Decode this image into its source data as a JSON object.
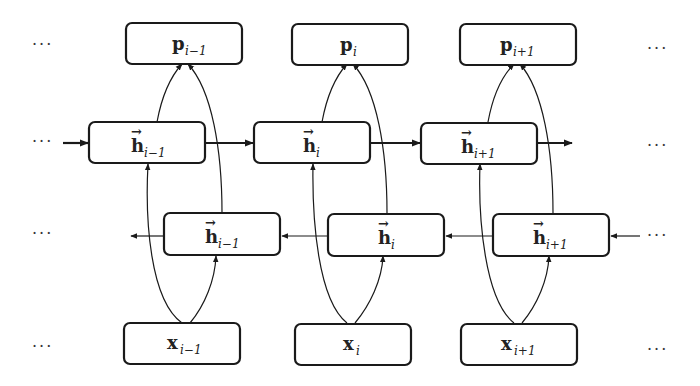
{
  "diagram": {
    "rows": {
      "outputs": [
        {
          "symbol": "p",
          "sub": "i−1",
          "arrow": ""
        },
        {
          "symbol": "p",
          "sub": "i",
          "arrow": ""
        },
        {
          "symbol": "p",
          "sub": "i+1",
          "arrow": ""
        }
      ],
      "forward_hidden": [
        {
          "symbol": "h",
          "sub": "i−1",
          "arrow": "→"
        },
        {
          "symbol": "h",
          "sub": "i",
          "arrow": "→"
        },
        {
          "symbol": "h",
          "sub": "i+1",
          "arrow": "→"
        }
      ],
      "backward_hidden": [
        {
          "symbol": "h",
          "sub": "i−1",
          "arrow": "→"
        },
        {
          "symbol": "h",
          "sub": "i",
          "arrow": "→"
        },
        {
          "symbol": "h",
          "sub": "i+1",
          "arrow": "→"
        }
      ],
      "inputs": [
        {
          "symbol": "x",
          "sub": "i−1",
          "arrow": ""
        },
        {
          "symbol": "x",
          "sub": "i",
          "arrow": ""
        },
        {
          "symbol": "x",
          "sub": "i+1",
          "arrow": ""
        }
      ]
    },
    "ellipsis": "···",
    "edges": [
      "x_{i-1} → forward h_{i-1}",
      "x_{i-1} → backward h_{i-1}",
      "x_i → forward h_i",
      "x_i → backward h_i",
      "x_{i+1} → forward h_{i+1}",
      "x_{i+1} → backward h_{i+1}",
      "forward h_{i-1} → p_{i-1}",
      "backward h_{i-1} → p_{i-1}",
      "forward h_i → p_i",
      "backward h_i → p_i",
      "forward h_{i+1} → p_{i+1}",
      "backward h_{i+1} → p_{i+1}",
      "forward h_{i-1} → forward h_i → forward h_{i+1} → ···",
      "··· → backward h_{i+1} → backward h_i → backward h_{i-1} → ···"
    ]
  }
}
